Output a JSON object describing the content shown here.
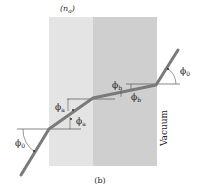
{
  "figure": {
    "header_cropped": "Substance a    Substance b",
    "index_label_a": "(n",
    "index_sub_a": "a",
    "index_close": ")",
    "caption": "(b)",
    "vacuum_label": "Vacuum",
    "angles": {
      "phi0_left": "ϕ0",
      "phia_upper": "ϕa",
      "phia_lower": "ϕa",
      "phib_upper": "ϕb",
      "phib_lower": "ϕb",
      "phi0_right": "ϕ0"
    },
    "colors": {
      "substance_a": "#e4e4e4",
      "substance_b": "#cfcfcf",
      "ray": "#777777",
      "normal": "#555555"
    }
  }
}
